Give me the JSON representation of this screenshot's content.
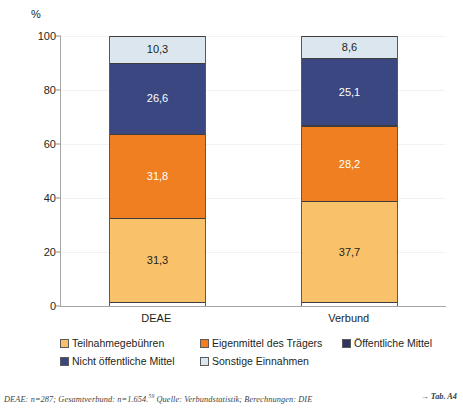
{
  "chart_data": {
    "type": "bar",
    "subtype": "stacked-100-percent",
    "title": "",
    "xlabel": "",
    "ylabel": "%",
    "ylim": [
      0,
      100
    ],
    "yticks": [
      "0",
      "20",
      "40",
      "60",
      "80",
      "100"
    ],
    "ytick_values": [
      0,
      20,
      40,
      60,
      80,
      100
    ],
    "grid": true,
    "grid_axis": "y",
    "legend_position": "bottom",
    "categories": [
      "DEAE",
      "Verbund"
    ],
    "series": [
      {
        "name": "Teilnahmegebühren",
        "color": "#f9c16a",
        "values": [
          31.3,
          37.7
        ],
        "labels": [
          "31,3",
          "37,7"
        ],
        "label_color": "#231f20"
      },
      {
        "name": "Eigenmittel des Trägers",
        "color": "#f07f22",
        "values": [
          31.8,
          28.2
        ],
        "labels": [
          "31,8",
          "28,2"
        ],
        "label_color": "#ffffff"
      },
      {
        "name": "Öffentliche Mittel",
        "color": "#2e3563",
        "values": [
          0.0,
          0.4
        ],
        "labels": [
          "",
          ""
        ],
        "label_color": "#ffffff"
      },
      {
        "name": "Nicht öffentliche Mittel",
        "color": "#3a4781",
        "values": [
          26.6,
          25.1
        ],
        "labels": [
          "26,6",
          "25,1"
        ],
        "label_color": "#ffffff"
      },
      {
        "name": "Sonstige Einnahmen",
        "color": "#dce6ef",
        "values": [
          10.3,
          8.6
        ],
        "labels": [
          "10,3",
          "8,6"
        ],
        "label_color": "#231f20"
      }
    ]
  },
  "axis": {
    "unit_label": "%"
  },
  "legend": {
    "rows": [
      [
        {
          "label": "Teilnahmegebühren",
          "color": "#f9c16a"
        },
        {
          "label": "Eigenmittel des Trägers",
          "color": "#f07f22"
        },
        {
          "label": "Öffentliche Mittel",
          "color": "#2e3563"
        }
      ],
      [
        {
          "label": "Nicht öffentliche Mittel",
          "color": "#3a4781"
        },
        {
          "label": "Sonstige Einnahmen",
          "color": "#dce6ef"
        }
      ]
    ]
  },
  "footnote": {
    "text_before": "DEAE: n=287; Gesamtverbund: n=1.654.",
    "superscript": "59",
    "text_after": " Quelle: Verbundstatistik; Berechnungen: DIE",
    "reference": "Tab. A4",
    "arrow": "→"
  }
}
